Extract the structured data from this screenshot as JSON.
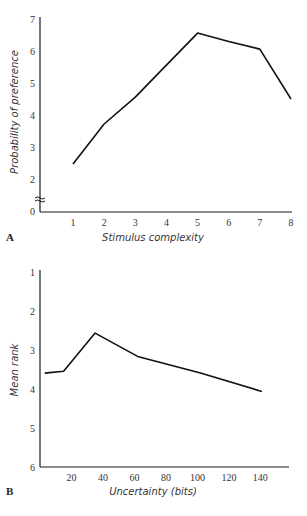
{
  "chart_data": [
    {
      "panel": "A",
      "type": "line",
      "title": "",
      "xlabel": "Stimulus complexity",
      "ylabel": "Probability of preference",
      "x": [
        1,
        2,
        3,
        4,
        5,
        6,
        7,
        8
      ],
      "values": [
        2.47,
        3.72,
        4.56,
        5.56,
        6.56,
        6.3,
        6.06,
        4.5
      ],
      "xticks": [
        1,
        2,
        3,
        4,
        5,
        6,
        7,
        8
      ],
      "yticks": [
        0,
        2,
        3,
        4,
        5,
        6,
        7
      ],
      "ylim": [
        0,
        7
      ],
      "xlim": [
        0,
        8
      ],
      "axis_break": "between 0 and 2 on y axis",
      "grid": false
    },
    {
      "panel": "B",
      "type": "line",
      "title": "",
      "xlabel": "Uncertainty (bits)",
      "ylabel": "Mean rank",
      "x": [
        3,
        15,
        35,
        62,
        102,
        141
      ],
      "values": [
        3.6,
        3.55,
        2.57,
        3.17,
        3.6,
        4.07
      ],
      "xticks": [
        20,
        40,
        60,
        80,
        100,
        120,
        140
      ],
      "yticks": [
        1,
        2,
        3,
        4,
        5,
        6
      ],
      "ylim": [
        6,
        1
      ],
      "y_inverted": true,
      "xlim": [
        0,
        160
      ],
      "grid": false
    }
  ],
  "panels": {
    "a_label": "A",
    "b_label": "B"
  }
}
